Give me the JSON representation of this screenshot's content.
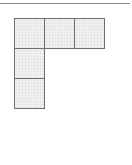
{
  "diagram": {
    "type": "polyomino-net",
    "cell_size": 31,
    "origin": {
      "x": 14,
      "y": 18
    },
    "fill_color": "#efefef",
    "stroke_color": "#6e6e6e",
    "cells": [
      {
        "row": 0,
        "col": 0
      },
      {
        "row": 0,
        "col": 1
      },
      {
        "row": 0,
        "col": 2
      },
      {
        "row": 1,
        "col": 0
      },
      {
        "row": 2,
        "col": 0
      }
    ]
  },
  "rule": {
    "color": "#8a8a8a"
  }
}
